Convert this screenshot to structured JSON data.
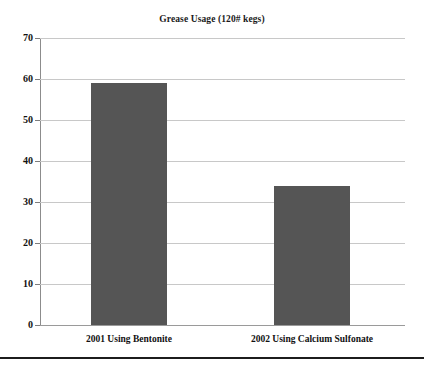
{
  "chart_data": {
    "type": "bar",
    "title": "Grease Usage (120# kegs)",
    "xlabel": "",
    "ylabel": "",
    "categories": [
      "2001 Using Bentonite",
      "2002 Using Calcium Sulfonate"
    ],
    "values": [
      59,
      34
    ],
    "ylim": [
      0,
      70
    ],
    "yticks": [
      0,
      10,
      20,
      30,
      40,
      50,
      60,
      70
    ],
    "ytick_labels": [
      "0",
      "10",
      "20",
      "30",
      "40",
      "50",
      "60",
      "70"
    ],
    "grid": true,
    "legend": false,
    "legend_position": "none",
    "series": [
      {
        "name": "Grease Usage",
        "values": [
          59,
          34
        ],
        "color": "#555555"
      }
    ],
    "colors": {
      "bar_fill": "#555555",
      "gridline": "#c8c8c8",
      "axis": "#8c8c8c",
      "text": "#111111",
      "background": "#ffffff",
      "bottom_rule": "#1c1c1c"
    }
  }
}
